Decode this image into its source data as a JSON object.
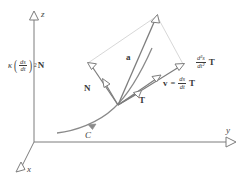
{
  "figure": {
    "type": "vector-diagram",
    "background_color": "#ffffff",
    "stroke_color": "#6b6b6b",
    "vector_color": "#7a7a7a",
    "construction_color": "#cfcfcf",
    "text_color": "#3a3a3a"
  },
  "axes": {
    "origin": {
      "x": 34,
      "y": 142
    },
    "z": {
      "label": "z",
      "tip": {
        "x": 34,
        "y": 14
      },
      "arrowhead": "hollow-triangle-up"
    },
    "y": {
      "label": "y",
      "tip": {
        "x": 234,
        "y": 142
      },
      "arrowhead": "hollow-triangle-right"
    },
    "x": {
      "label": "x",
      "tip": {
        "x": 13,
        "y": 172
      },
      "arrowhead": "hollow-triangle-downleft"
    }
  },
  "curve": {
    "name": "C",
    "label": "C",
    "direction_arrow": true,
    "color": "#7a7a7a"
  },
  "point": {
    "x": 118,
    "y": 105,
    "label": ""
  },
  "vectors": {
    "normal_component": {
      "name": "normal-acceleration-component",
      "tip": {
        "x": 88,
        "y": 63
      },
      "label_kappa": "κ",
      "label_frac_num": "ds",
      "label_frac_den": "dt",
      "label_exponent": "2",
      "label_vector": "N"
    },
    "tangential_component": {
      "name": "tangential-acceleration-component",
      "tip": {
        "x": 183,
        "y": 64
      },
      "label_frac_num": "d²s",
      "label_frac_den": "dt²",
      "label_vector": "T"
    },
    "acceleration": {
      "name": "acceleration-vector",
      "tip": {
        "x": 157,
        "y": 16
      },
      "label": "a"
    },
    "velocity": {
      "name": "velocity-vector",
      "tip": {
        "x": 160,
        "y": 76
      },
      "label_vector": "v",
      "label_equals": "=",
      "label_frac_num": "ds",
      "label_frac_den": "dt",
      "label_unit": "T"
    },
    "unit_normal": {
      "name": "unit-normal-vector",
      "label": "N",
      "tip": {
        "x": 103,
        "y": 80
      }
    },
    "unit_tangent": {
      "name": "unit-tangent-vector",
      "label": "T",
      "tip": {
        "x": 140,
        "y": 92
      }
    }
  }
}
